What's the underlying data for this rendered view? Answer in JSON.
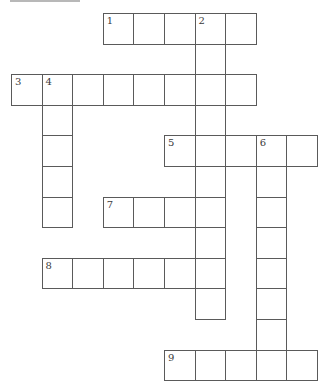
{
  "puzzle": {
    "type": "crossword",
    "grid_origin": {
      "x": 11,
      "y": 13
    },
    "cell_size": 30.6,
    "colors": {
      "line": "#5a5a5a",
      "number": "#3a3a3a",
      "background": "#ffffff",
      "top_rule": "#b8b8b8"
    },
    "entries": [
      {
        "number": "1",
        "direction": "across",
        "row": 0,
        "col": 3,
        "length": 5
      },
      {
        "number": "2",
        "direction": "down",
        "row": 0,
        "col": 6,
        "length": 10
      },
      {
        "number": "3",
        "direction": "across",
        "row": 2,
        "col": 0,
        "length": 8
      },
      {
        "number": "4",
        "direction": "down",
        "row": 2,
        "col": 1,
        "length": 5
      },
      {
        "number": "5",
        "direction": "across",
        "row": 4,
        "col": 5,
        "length": 5
      },
      {
        "number": "6",
        "direction": "down",
        "row": 4,
        "col": 8,
        "length": 8
      },
      {
        "number": "7",
        "direction": "across",
        "row": 6,
        "col": 3,
        "length": 4
      },
      {
        "number": "8",
        "direction": "across",
        "row": 8,
        "col": 1,
        "length": 6
      },
      {
        "number": "9",
        "direction": "across",
        "row": 11,
        "col": 5,
        "length": 5
      }
    ]
  }
}
